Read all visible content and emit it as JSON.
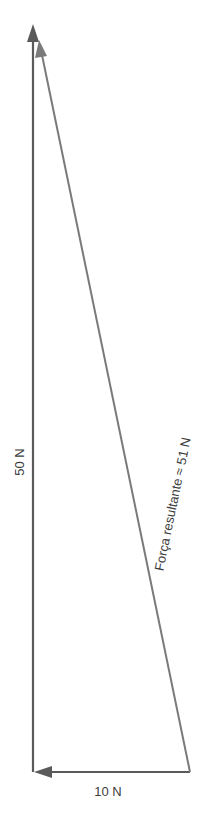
{
  "diagram": {
    "type": "vector-triangle",
    "colors": {
      "vertical": "#5a5a5a",
      "horizontal": "#5a5a5a",
      "resultant": "#7a7a7a",
      "text": "#3c3c3c"
    },
    "vectors": [
      {
        "name": "vertical-force",
        "label": "50 N",
        "magnitude": 50,
        "direction": "up"
      },
      {
        "name": "horizontal-force",
        "label": "10 N",
        "magnitude": 10,
        "direction": "left"
      },
      {
        "name": "resultant-force",
        "label": "Força resultante ≈ 51 N",
        "magnitude": 51,
        "direction": "up-left"
      }
    ]
  }
}
